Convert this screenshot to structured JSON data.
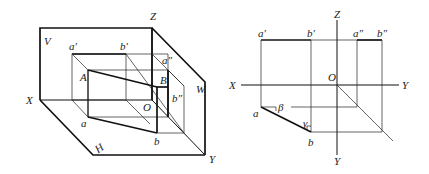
{
  "left_diagram": {
    "title": "Pictorial view of line AB in three projection planes",
    "planes": {
      "V": "V",
      "H": "H",
      "W": "W"
    },
    "axes": {
      "X": "X",
      "Y": "Y",
      "Z": "Z",
      "O": "O"
    },
    "points": {
      "A": "A",
      "B": "B",
      "a": "a",
      "b": "b",
      "a1": "a′",
      "b1": "b′",
      "a2": "a″",
      "b2": "b″"
    }
  },
  "right_diagram": {
    "title": "Orthographic projections of line AB",
    "axes": {
      "X": "X",
      "Y_right": "Y",
      "Y_down": "Y",
      "Z": "Z",
      "O": "O"
    },
    "points": {
      "a1": "a′",
      "b1": "b′",
      "a2": "a″",
      "b2": "b″",
      "a": "a",
      "b": "b"
    },
    "angles": {
      "beta": "β",
      "gamma": "γ"
    }
  },
  "colors": {
    "line": "#111111",
    "background": "#ffffff"
  }
}
